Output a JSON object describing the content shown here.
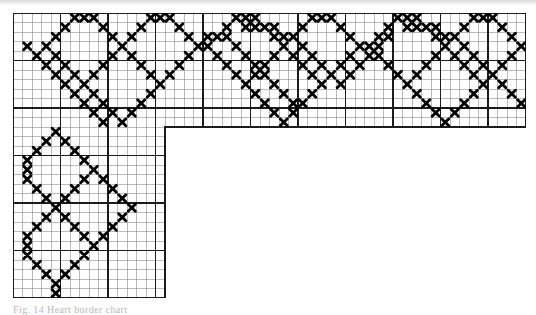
{
  "figure": {
    "kind": "cross-stitch-pattern-chart",
    "title_caption": "Fig. 14 Heart border chart",
    "symbol_name": "cross-stitch-x",
    "symbol_glyph": "X",
    "colors": {
      "stitch": "#000000",
      "grid_minor": "#8d8d8d",
      "grid_major": "#1c1c1c",
      "background": "#ffffff",
      "scan_edge": "#d8d8d8"
    },
    "grid": {
      "cell_px": 9.5,
      "minor_every": 1,
      "major_every": 5,
      "origin_x_px": 13,
      "origin_y_px": 13,
      "cols_total": 54,
      "rows_total": 30,
      "arm_horizontal_cols": 54,
      "arm_horizontal_rows": 12,
      "arm_vertical_cols": 16,
      "arm_vertical_rows": 30
    },
    "legend": {
      "symbol_label": "X",
      "meaning": "one cross stitch"
    }
  },
  "chart_data": {
    "type": "heatmap",
    "xlabel": "stitch column",
    "ylabel": "stitch row",
    "grid": true,
    "legend_position": "none",
    "categories": [],
    "values": [],
    "cols": 54,
    "rows": 30,
    "region_mask": {
      "description": "L-shaped chart area: full-width horizontal band on top, narrow vertical arm at left",
      "horizontal_band": {
        "col_start": 0,
        "col_end": 53,
        "row_start": 0,
        "row_end": 11
      },
      "vertical_arm": {
        "col_start": 0,
        "col_end": 15,
        "row_start": 12,
        "row_end": 29
      }
    },
    "stitches": [
      [
        24,
        1
      ],
      [
        25,
        1
      ],
      [
        26,
        1
      ],
      [
        27,
        1
      ],
      [
        41,
        1
      ],
      [
        42,
        1
      ],
      [
        43,
        1
      ],
      [
        44,
        1
      ],
      [
        58,
        1
      ],
      [
        20,
        2
      ],
      [
        22,
        2
      ],
      [
        28,
        2
      ],
      [
        29,
        2
      ],
      [
        39,
        2
      ],
      [
        45,
        2
      ],
      [
        46,
        2
      ],
      [
        19,
        3
      ],
      [
        23,
        3
      ],
      [
        30,
        3
      ],
      [
        38,
        3
      ],
      [
        47,
        3
      ],
      [
        18,
        4
      ],
      [
        24,
        4
      ],
      [
        31,
        4
      ],
      [
        37,
        4
      ],
      [
        48,
        4
      ],
      [
        17,
        5
      ],
      [
        25,
        5
      ],
      [
        32,
        5
      ],
      [
        36,
        5
      ],
      [
        49,
        5
      ],
      [
        16,
        6
      ],
      [
        26,
        6
      ],
      [
        33,
        6
      ],
      [
        35,
        6
      ],
      [
        50,
        6
      ],
      [
        15,
        7
      ],
      [
        27,
        7
      ],
      [
        34,
        7
      ],
      [
        51,
        7
      ],
      [
        14,
        8
      ],
      [
        28,
        8
      ],
      [
        52,
        8
      ],
      [
        13,
        9
      ],
      [
        29,
        9
      ],
      [
        53,
        9
      ]
    ],
    "motif": {
      "name": "heart",
      "repeat_width_cols": 17,
      "repeat_count_horizontal": 3,
      "repeat_count_vertical": 2,
      "notes": "Each heart is formed by two upper lobes (3 stitches wide crowns) converging to a single point at the bottom; hearts link at shared shoulder stitches."
    },
    "axis_ranges": {
      "x": [
        0,
        54
      ],
      "y": [
        0,
        30
      ]
    }
  }
}
